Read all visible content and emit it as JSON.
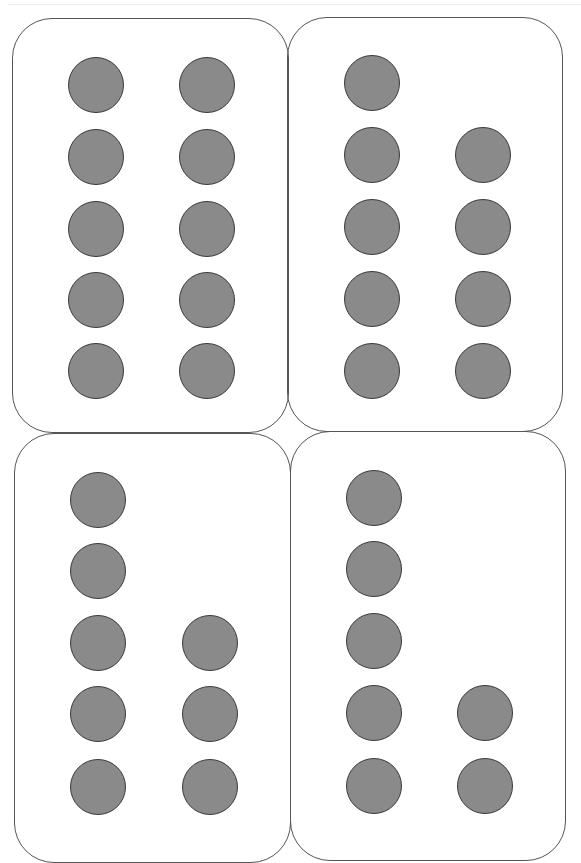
{
  "page": {
    "colors": {
      "background": "#ffffff",
      "card_border": "#555555",
      "dot_fill": "#8a8a8a",
      "dot_border": "#3a3a3a",
      "top_rule": "#ececec"
    }
  },
  "cards": [
    {
      "id": "card-1",
      "position": "top-left",
      "dot_count": 10,
      "count_label": "10",
      "rect": {
        "left": 12,
        "top": 18,
        "width": 277,
        "height": 415
      },
      "columns_x": [
        95,
        206
      ],
      "rows_y": [
        84,
        156,
        228,
        299,
        370
      ],
      "dots": [
        {
          "col": 0,
          "row": 0
        },
        {
          "col": 1,
          "row": 0
        },
        {
          "col": 0,
          "row": 1
        },
        {
          "col": 1,
          "row": 1
        },
        {
          "col": 0,
          "row": 2
        },
        {
          "col": 1,
          "row": 2
        },
        {
          "col": 0,
          "row": 3
        },
        {
          "col": 1,
          "row": 3
        },
        {
          "col": 0,
          "row": 4
        },
        {
          "col": 1,
          "row": 4
        }
      ]
    },
    {
      "id": "card-2",
      "position": "top-right",
      "dot_count": 9,
      "count_label": "9",
      "rect": {
        "left": 287,
        "top": 17,
        "width": 276,
        "height": 415
      },
      "columns_x": [
        371,
        482
      ],
      "rows_y": [
        82,
        154,
        226,
        298,
        370
      ],
      "dots": [
        {
          "col": 0,
          "row": 0
        },
        {
          "col": 0,
          "row": 1
        },
        {
          "col": 1,
          "row": 1
        },
        {
          "col": 0,
          "row": 2
        },
        {
          "col": 1,
          "row": 2
        },
        {
          "col": 0,
          "row": 3
        },
        {
          "col": 1,
          "row": 3
        },
        {
          "col": 0,
          "row": 4
        },
        {
          "col": 1,
          "row": 4
        }
      ]
    },
    {
      "id": "card-3",
      "position": "bottom-left",
      "dot_count": 8,
      "count_label": "8",
      "rect": {
        "left": 14,
        "top": 433,
        "width": 277,
        "height": 430
      },
      "columns_x": [
        97,
        209
      ],
      "rows_y": [
        499,
        570,
        642,
        713,
        786
      ],
      "dots": [
        {
          "col": 0,
          "row": 0
        },
        {
          "col": 0,
          "row": 1
        },
        {
          "col": 0,
          "row": 2
        },
        {
          "col": 1,
          "row": 2
        },
        {
          "col": 0,
          "row": 3
        },
        {
          "col": 1,
          "row": 3
        },
        {
          "col": 0,
          "row": 4
        },
        {
          "col": 1,
          "row": 4
        }
      ]
    },
    {
      "id": "card-4",
      "position": "bottom-right",
      "dot_count": 7,
      "count_label": "7",
      "rect": {
        "left": 290,
        "top": 431,
        "width": 276,
        "height": 430
      },
      "columns_x": [
        373,
        484
      ],
      "rows_y": [
        497,
        568,
        640,
        712,
        785
      ],
      "dots": [
        {
          "col": 0,
          "row": 0
        },
        {
          "col": 0,
          "row": 1
        },
        {
          "col": 0,
          "row": 2
        },
        {
          "col": 0,
          "row": 3
        },
        {
          "col": 1,
          "row": 3
        },
        {
          "col": 0,
          "row": 4
        },
        {
          "col": 1,
          "row": 4
        }
      ]
    }
  ]
}
